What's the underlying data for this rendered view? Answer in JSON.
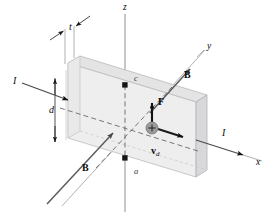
{
  "figure": {
    "type": "physics-diagram",
    "width": 272,
    "height": 216,
    "background_color": "#ffffff"
  },
  "axes": [
    {
      "name": "z-axis",
      "label": "z",
      "direction": "up",
      "label_x": 123,
      "label_y": 4
    },
    {
      "name": "y-axis",
      "label": "y",
      "direction": "up-right (into page depth)",
      "label_x": 207,
      "label_y": 43
    },
    {
      "name": "x-axis",
      "label": "x",
      "direction": "down-right",
      "label_x": 256,
      "label_y": 159
    }
  ],
  "dimensions": [
    {
      "name": "thickness",
      "label": "t",
      "label_x": 69,
      "label_y": 23
    },
    {
      "name": "depth",
      "label": "d",
      "label_x": 50,
      "label_y": 110
    }
  ],
  "nodes": [
    {
      "name": "upper-terminal",
      "label": "c",
      "label_x": 134,
      "label_y": 75
    },
    {
      "name": "lower-terminal",
      "label": "a",
      "label_x": 134,
      "label_y": 168
    }
  ],
  "currents": [
    {
      "name": "current-in",
      "label": "I",
      "label_x": 13,
      "label_y": 79
    },
    {
      "name": "current-out",
      "label": "I",
      "label_x": 222,
      "label_y": 131
    }
  ],
  "vectors": [
    {
      "name": "magnetic-field-upper",
      "label": "B",
      "label_x": 184,
      "label_y": 73
    },
    {
      "name": "magnetic-field-lower",
      "label": "B",
      "label_x": 82,
      "label_y": 166
    },
    {
      "name": "magnetic-force",
      "label": "F",
      "label_x": 158,
      "label_y": 99
    },
    {
      "name": "drift-velocity",
      "label": "v",
      "subscript": "d",
      "label_x": 152,
      "label_y": 144
    }
  ],
  "carrier": {
    "name": "positive-charge-carrier",
    "sign": "+",
    "center_x": 152,
    "center_y": 128,
    "radius": 6,
    "fill_color": "#9a9a9a"
  },
  "colors": {
    "slab_front_face": "#ececed",
    "slab_top_face": "#e2e2e3",
    "slab_right_face": "#d7d7d8",
    "slab_edge": "#b4b4b6",
    "axis_line": "#8f8f91",
    "vector_line": "#55565a",
    "hidden_line": "#6d6e71",
    "text": "#0a0a0a"
  }
}
